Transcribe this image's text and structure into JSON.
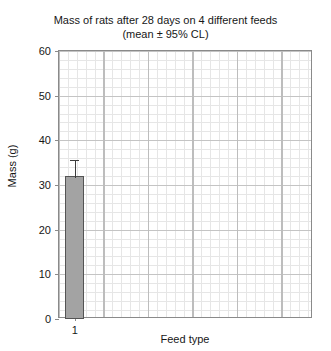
{
  "chart_data": {
    "type": "bar",
    "title": "Mass of rats after 28 days on 4 different feeds",
    "subtitle": "(mean ± 95% CL)",
    "xlabel": "Feed type",
    "ylabel": "Mass (g)",
    "categories": [
      "1"
    ],
    "values": [
      32
    ],
    "errors": [
      3.5
    ],
    "error_type": "95% CL",
    "ylim": [
      0,
      60
    ],
    "yticks": [
      0,
      10,
      20,
      30,
      40,
      50,
      60
    ],
    "ytick_labels": [
      "0",
      "10",
      "20",
      "30",
      "40",
      "50",
      "60"
    ],
    "xlim_categories": 8,
    "grid": true,
    "grid_minor": true,
    "legend": false,
    "bar_color": "#a3a3a3",
    "bar_edge_color": "#545454",
    "error_color": "#3d3d3d",
    "grid_major_color": "#c4c4c4",
    "grid_minor_color": "#e6e6e6",
    "frame_color": "#8a8a8a",
    "text_color": "#171717",
    "background": "#ffffff"
  }
}
